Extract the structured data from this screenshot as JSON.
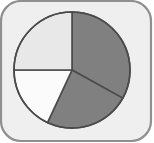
{
  "window": {
    "title": "Pie Chart",
    "icon_name": "pie-chart-icon"
  },
  "frame": {
    "name": "rounded-panel",
    "fill_color": "#efefef",
    "border_color": "#8f8f8f",
    "corner_radius": 20,
    "border_width": 2,
    "x": 1,
    "y": 1,
    "width": 150,
    "height": 140
  },
  "chart_data": {
    "type": "pie",
    "title": "",
    "subtitle": "",
    "xlabel": "",
    "ylabel": "",
    "grid": false,
    "legend_position": "none",
    "labels_visible": false,
    "center_x": 72,
    "center_y": 70,
    "radius": 58,
    "start_angle_deg": 0,
    "direction": "clockwise",
    "outline_color": "#4a4a4a",
    "outline_width": 1.6,
    "categories": [
      "Slice A",
      "Slice B",
      "Slice C",
      "Slice D"
    ],
    "values": [
      33.1,
      23.9,
      15.3,
      27.7
    ],
    "slices": [
      {
        "label": "Slice A",
        "value": 33.1,
        "percent": 33.1,
        "color": "#808080",
        "start_angle_deg": 0,
        "end_angle_deg": 119
      },
      {
        "label": "Slice B",
        "value": 23.9,
        "percent": 23.9,
        "color": "#808080",
        "start_angle_deg": 119,
        "end_angle_deg": 205
      },
      {
        "label": "Slice C",
        "value": 15.3,
        "percent": 15.3,
        "color": "#fbfbfb",
        "start_angle_deg": 205,
        "end_angle_deg": 270
      },
      {
        "label": "Slice D",
        "value": 27.7,
        "percent": 27.7,
        "color": "#e8e8e8",
        "start_angle_deg": 270,
        "end_angle_deg": 360
      }
    ]
  }
}
